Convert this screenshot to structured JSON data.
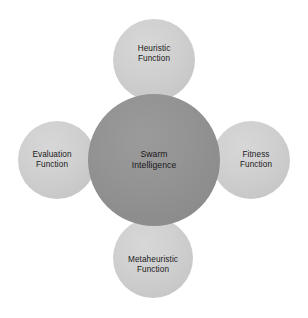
{
  "diagram": {
    "type": "hub-and-spoke",
    "background_color": "#ffffff",
    "center": {
      "id": "swarm-intelligence",
      "label": "Swarm\nIntelligence",
      "line1": "Swarm",
      "line2": "Intelligence",
      "fill_color": "#909090",
      "text_color": "#171717"
    },
    "satellites": [
      {
        "id": "heuristic-function",
        "position": "top",
        "label": "Heuristic\nFunction",
        "line1": "Heuristic",
        "line2": "Function",
        "fill_color": "#cfcfcf",
        "text_color": "#191919"
      },
      {
        "id": "evaluation-function",
        "position": "left",
        "label": "Evaluation\nFunction",
        "line1": "Evaluation",
        "line2": "Function",
        "fill_color": "#cfcfcf",
        "text_color": "#191919"
      },
      {
        "id": "fitness-function",
        "position": "right",
        "label": "Fitness\nFunction",
        "line1": "Fitness",
        "line2": "Function",
        "fill_color": "#cfcfcf",
        "text_color": "#191919"
      },
      {
        "id": "metaheuristic-function",
        "position": "bottom",
        "label": "Metaheuristic\nFunction",
        "line1": "Metaheuristic",
        "line2": "Function",
        "fill_color": "#cfcfcf",
        "text_color": "#191919"
      }
    ]
  }
}
